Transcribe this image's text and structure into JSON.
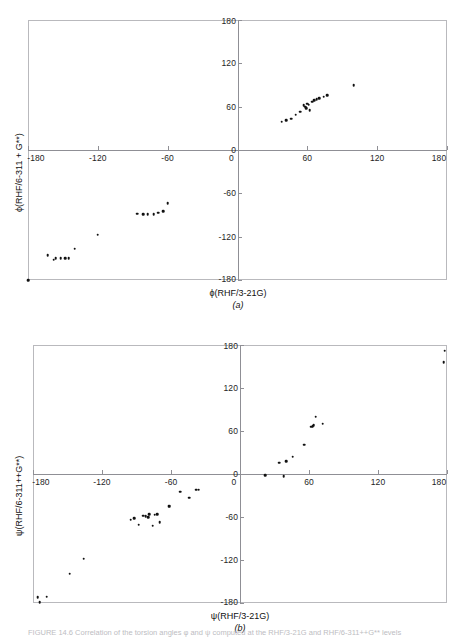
{
  "figure": {
    "caption": "FIGURE 14.6  Correlation of the torsion angles φ and ψ computed at the RHF/3-21G and RHF/6-311++G** levels",
    "header_artifact": ""
  },
  "panels": [
    {
      "id": "a",
      "caption": "(a)",
      "xlabel": "ϕ(RHF/3-21G)",
      "ylabel": "ϕ(RHF/6-311 + G**)",
      "axis_color": "#8f8f95",
      "frame_color": "#b9b9bd",
      "point_color": "#111111"
    },
    {
      "id": "b",
      "caption": "(b)",
      "xlabel": "ψ(RHF/3-21G)",
      "ylabel": "ψ(RHF/6-311++G**)",
      "axis_color": "#8f8f95",
      "frame_color": "#b9b9bd",
      "point_color": "#111111"
    }
  ],
  "chart_data": [
    {
      "type": "scatter",
      "panel": "a",
      "title": "",
      "xlabel": "ϕ(RHF/3-21G)",
      "ylabel": "ϕ(RHF/6-311 + G**)",
      "xlim": [
        -180,
        180
      ],
      "ylim": [
        -180,
        180
      ],
      "xticks": [
        -180,
        -120,
        -60,
        0,
        60,
        120,
        180
      ],
      "yticks": [
        -180,
        -120,
        -60,
        0,
        60,
        120,
        180
      ],
      "xtick_labels": [
        "-180",
        "-120",
        "-60",
        "0",
        "60",
        "120",
        "180"
      ],
      "ytick_labels": [
        "-180",
        "-120",
        "-60",
        "0",
        "60",
        "120",
        "180"
      ],
      "grid": false,
      "legend": "none",
      "origin_axes": true,
      "points": [
        [
          -180,
          -180
        ],
        [
          -163,
          -146
        ],
        [
          -158,
          -152
        ],
        [
          -156,
          -150
        ],
        [
          -152,
          -150
        ],
        [
          -148,
          -150
        ],
        [
          -145,
          -150
        ],
        [
          -140,
          -137
        ],
        [
          -120,
          -117
        ],
        [
          -86,
          -88
        ],
        [
          -81,
          -89
        ],
        [
          -77,
          -89
        ],
        [
          -72,
          -89
        ],
        [
          -68,
          -87
        ],
        [
          -64,
          -85
        ],
        [
          -60,
          -74
        ],
        [
          38,
          39
        ],
        [
          42,
          41
        ],
        [
          46,
          43
        ],
        [
          50,
          49
        ],
        [
          54,
          53
        ],
        [
          57,
          62
        ],
        [
          58,
          60
        ],
        [
          59,
          58
        ],
        [
          60,
          64
        ],
        [
          61,
          63
        ],
        [
          62,
          55
        ],
        [
          64,
          67
        ],
        [
          66,
          69
        ],
        [
          68,
          70
        ],
        [
          70,
          72
        ],
        [
          74,
          74
        ],
        [
          77,
          76
        ],
        [
          100,
          90
        ]
      ]
    },
    {
      "type": "scatter",
      "panel": "b",
      "title": "",
      "xlabel": "ψ(RHF/3-21G)",
      "ylabel": "ψ(RHF/6-311++G**)",
      "xlim": [
        -180,
        180
      ],
      "ylim": [
        -180,
        180
      ],
      "xticks": [
        -180,
        -120,
        -60,
        0,
        60,
        120,
        180
      ],
      "yticks": [
        -180,
        -120,
        -60,
        0,
        60,
        120,
        180
      ],
      "xtick_labels": [
        "-180",
        "-120",
        "-60",
        "0",
        "60",
        "120",
        "180"
      ],
      "ytick_labels": [
        "-180",
        "-120",
        "-60",
        "0",
        "60",
        "120",
        "180"
      ],
      "grid": false,
      "legend": "none",
      "origin_axes": true,
      "points": [
        [
          -176,
          -172
        ],
        [
          -174,
          -179
        ],
        [
          -168,
          -171
        ],
        [
          -148,
          -139
        ],
        [
          -136,
          -118
        ],
        [
          -95,
          -64
        ],
        [
          -92,
          -62
        ],
        [
          -88,
          -71
        ],
        [
          -84,
          -58
        ],
        [
          -82,
          -59
        ],
        [
          -80,
          -60
        ],
        [
          -79,
          -56
        ],
        [
          -76,
          -72
        ],
        [
          -74,
          -57
        ],
        [
          -72,
          -56
        ],
        [
          -70,
          -67
        ],
        [
          -62,
          -45
        ],
        [
          -61,
          -45
        ],
        [
          -52,
          -25
        ],
        [
          -44,
          -33
        ],
        [
          -38,
          -22
        ],
        [
          -36,
          -22
        ],
        [
          22,
          -2
        ],
        [
          38,
          -3
        ],
        [
          34,
          16
        ],
        [
          40,
          18
        ],
        [
          46,
          24
        ],
        [
          56,
          41
        ],
        [
          62,
          66
        ],
        [
          63,
          67
        ],
        [
          64,
          68
        ],
        [
          66,
          80
        ],
        [
          72,
          70
        ],
        [
          178,
          172
        ],
        [
          177,
          156
        ]
      ]
    }
  ]
}
